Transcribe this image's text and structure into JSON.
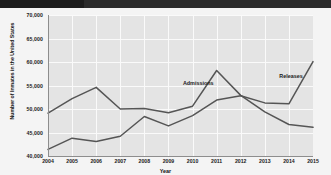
{
  "chart_data": {
    "type": "line",
    "title": "",
    "xlabel": "Year",
    "ylabel": "Number of Inmates in the United States",
    "x": [
      2004,
      2005,
      2006,
      2007,
      2008,
      2009,
      2010,
      2011,
      2012,
      2013,
      2014,
      2015
    ],
    "xlim": [
      2004,
      2015
    ],
    "ylim": [
      40000,
      70000
    ],
    "yticks": [
      40000,
      45000,
      50000,
      55000,
      60000,
      65000,
      70000
    ],
    "ytick_labels": [
      "40,000",
      "45,000",
      "50,000",
      "55,000",
      "60,000",
      "65,000",
      "70,000"
    ],
    "xtick_labels": [
      "2004",
      "2005",
      "2006",
      "2007",
      "2008",
      "2009",
      "2010",
      "2011",
      "2012",
      "2013",
      "2014",
      "2015"
    ],
    "grid": true,
    "legend_position": "inline-annotations",
    "series": [
      {
        "name": "Admissions",
        "color": "#555555",
        "values": [
          49100,
          52200,
          54600,
          50000,
          50100,
          49200,
          50600,
          58200,
          52900,
          49400,
          46700,
          46100
        ]
      },
      {
        "name": "Releases",
        "color": "#555555",
        "values": [
          41400,
          43800,
          43100,
          44200,
          48400,
          46400,
          48600,
          51900,
          52800,
          51300,
          51100,
          60100
        ]
      }
    ],
    "annotations": [
      {
        "text": "Admissions",
        "x": 2009.6,
        "y": 56200
      },
      {
        "text": "Releases",
        "x": 2013.6,
        "y": 57600
      }
    ]
  }
}
